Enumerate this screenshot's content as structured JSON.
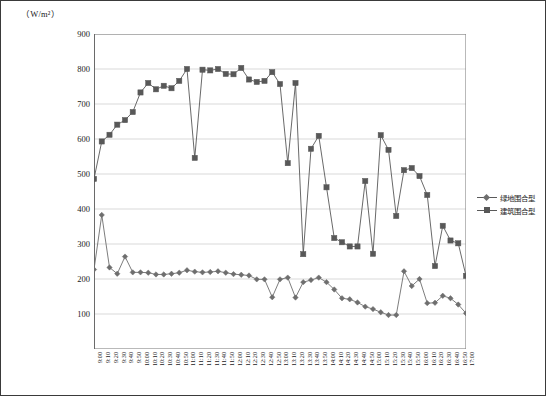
{
  "axis_unit": "（W/m²）",
  "legend": {
    "position": "right",
    "items": [
      {
        "label": "绿地围合型",
        "marker": "diamond",
        "color": "#6e6e6e"
      },
      {
        "label": "建筑围合型",
        "marker": "square",
        "color": "#585858"
      }
    ]
  },
  "chart_data": {
    "type": "line",
    "title": "",
    "subtitle": "",
    "xlabel": "",
    "ylabel": "（W/m²）",
    "ylim": [
      0,
      900
    ],
    "yticks": [
      100,
      200,
      300,
      400,
      500,
      600,
      700,
      800,
      900
    ],
    "grid": true,
    "legend_position": "right",
    "x": [
      "9:00",
      "9:10",
      "9:20",
      "9:30",
      "9:40",
      "9:50",
      "10:00",
      "10:10",
      "10:20",
      "10:30",
      "10:40",
      "10:50",
      "11:00",
      "11:10",
      "11:20",
      "11:30",
      "11:40",
      "11:50",
      "12:00",
      "12:10",
      "12:20",
      "12:30",
      "12:40",
      "12:50",
      "13:00",
      "13:10",
      "13:20",
      "13:30",
      "13:40",
      "13:50",
      "14:00",
      "14:10",
      "14:20",
      "14:30",
      "14:40",
      "14:50",
      "15:00",
      "15:10",
      "15:20",
      "15:30",
      "15:40",
      "15:50",
      "16:00",
      "16:10",
      "16:20",
      "16:30",
      "16:40",
      "16:50",
      "17:00"
    ],
    "series": [
      {
        "name": "绿地围合型",
        "marker": "diamond",
        "color": "#6e6e6e",
        "values": [
          227,
          383,
          233,
          215,
          264,
          219,
          219,
          218,
          213,
          213,
          215,
          218,
          225,
          221,
          219,
          220,
          222,
          218,
          214,
          212,
          210,
          199,
          199,
          148,
          199,
          204,
          147,
          191,
          197,
          204,
          191,
          170,
          145,
          142,
          133,
          121,
          114,
          105,
          97,
          97,
          222,
          180,
          200,
          131,
          132,
          152,
          145,
          127,
          102
        ]
      },
      {
        "name": "建筑围合型",
        "marker": "square",
        "color": "#585858",
        "values": [
          486,
          593,
          612,
          641,
          654,
          677,
          733,
          760,
          742,
          752,
          745,
          766,
          800,
          546,
          798,
          796,
          800,
          786,
          785,
          803,
          770,
          763,
          766,
          791,
          757,
          531,
          760,
          271,
          572,
          609,
          462,
          317,
          305,
          293,
          293,
          480,
          272,
          611,
          569,
          380,
          511,
          517,
          494,
          440,
          237,
          352,
          310,
          302,
          209
        ]
      }
    ]
  }
}
